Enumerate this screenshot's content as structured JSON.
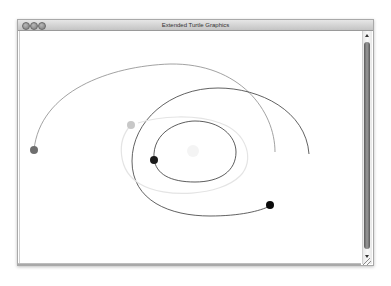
{
  "window": {
    "title": "Extended Turtle Graphics",
    "buttons": {
      "close": "close-button",
      "minimize": "minimize-button",
      "zoom": "zoom-button"
    }
  },
  "canvas": {
    "background": "#ffffff",
    "paths": [
      {
        "name": "outer-grey-arc",
        "d": "M 14 119 C 20 60, 90 35, 150 33 C 220 32, 255 80, 255 121",
        "stroke": "#8a8a8a",
        "width": 0.8
      },
      {
        "name": "large-dark-spiral",
        "d": "M 289 123 C 286 80, 240 57, 198 57 C 150 57, 112 90, 112 130 C 112 170, 150 185, 190 185 C 220 185, 240 180, 250 175",
        "stroke": "#3a3a3a",
        "width": 0.8
      },
      {
        "name": "inner-dark-ellipse",
        "d": "M 134 128 C 132 100, 160 90, 175 90 C 200 90, 216 105, 216 121 C 216 140, 200 151, 175 151 C 150 151, 136 143, 134 128",
        "stroke": "#333333",
        "width": 0.8
      },
      {
        "name": "faint-grey-ellipse",
        "d": "M 111 94 C 96 110, 98 140, 120 153 C 145 168, 200 165, 220 145 C 235 130, 228 102, 200 92 C 175 83, 140 85, 118 92",
        "stroke": "#e4e4e4",
        "width": 1.2
      }
    ],
    "dots": [
      {
        "name": "grey-turtle-dot",
        "cx": 14,
        "cy": 119,
        "r": 4,
        "fill": "#6e6e6e"
      },
      {
        "name": "light-turtle-dot",
        "cx": 111,
        "cy": 94,
        "r": 4,
        "fill": "#c8c8c8"
      },
      {
        "name": "dark-turtle-dot-inner",
        "cx": 134,
        "cy": 129,
        "r": 4,
        "fill": "#1a1a1a"
      },
      {
        "name": "black-turtle-dot",
        "cx": 250,
        "cy": 174,
        "r": 4,
        "fill": "#0a0a0a"
      },
      {
        "name": "faint-center-dot",
        "cx": 173,
        "cy": 120,
        "r": 6,
        "fill": "#f4f4f4"
      }
    ]
  },
  "scrollbar": {
    "orientation": "vertical"
  }
}
